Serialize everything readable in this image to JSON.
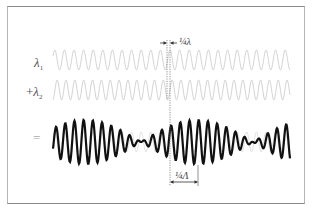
{
  "diagram": {
    "rows": [
      {
        "label": "λ",
        "subscript": "1",
        "prefix": "",
        "role": "wave-1",
        "color": "#c8c8c8"
      },
      {
        "label": "λ",
        "subscript": "2",
        "prefix": "+",
        "role": "wave-2",
        "color": "#c8c8c8"
      },
      {
        "label": "",
        "subscript": "",
        "prefix": "=",
        "role": "sum",
        "color": "#111111"
      }
    ],
    "annotations": {
      "phase_shift": "¼λ",
      "beat_quarter": "¼Λ"
    },
    "colors": {
      "frame": "#8a8a8a",
      "component_wave": "#c8c8c8",
      "sum_wave": "#111111",
      "guide_line": "#777777"
    },
    "wave_params": {
      "x_start": 53,
      "x_end": 290,
      "period_1_px": 9.6,
      "beat_period_px": 112,
      "beat_max_x": 85
    }
  }
}
